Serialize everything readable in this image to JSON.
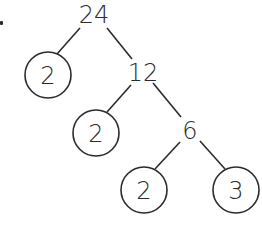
{
  "diagram": {
    "type": "factor-tree",
    "root": "24",
    "nodes": [
      {
        "id": "n24",
        "value": "24",
        "kind": "composite",
        "x": 94,
        "y": 15
      },
      {
        "id": "n2a",
        "value": "2",
        "kind": "prime",
        "x": 48,
        "y": 75
      },
      {
        "id": "n12",
        "value": "12",
        "kind": "composite",
        "x": 143,
        "y": 73
      },
      {
        "id": "n2b",
        "value": "2",
        "kind": "prime",
        "x": 96,
        "y": 133
      },
      {
        "id": "n6",
        "value": "6",
        "kind": "composite",
        "x": 190,
        "y": 131
      },
      {
        "id": "n2c",
        "value": "2",
        "kind": "prime",
        "x": 144,
        "y": 190
      },
      {
        "id": "n3",
        "value": "3",
        "kind": "prime",
        "x": 236,
        "y": 190
      }
    ],
    "edges": [
      {
        "from": "24",
        "to": "2",
        "x1": 80,
        "y1": 28,
        "x2": 57,
        "y2": 54
      },
      {
        "from": "24",
        "to": "12",
        "x1": 107,
        "y1": 28,
        "x2": 132,
        "y2": 59
      },
      {
        "from": "12",
        "to": "2",
        "x1": 131,
        "y1": 85,
        "x2": 107,
        "y2": 112
      },
      {
        "from": "12",
        "to": "6",
        "x1": 153,
        "y1": 83,
        "x2": 181,
        "y2": 117
      },
      {
        "from": "6",
        "to": "2",
        "x1": 180,
        "y1": 142,
        "x2": 155,
        "y2": 169
      },
      {
        "from": "6",
        "to": "3",
        "x1": 200,
        "y1": 141,
        "x2": 225,
        "y2": 169
      }
    ],
    "circle_radius": 23,
    "line_color": "#2b2b2b",
    "prime_factors": [
      "2",
      "2",
      "2",
      "3"
    ]
  },
  "labels": {
    "root": "24",
    "left_prime_1": "2",
    "mid_composite": "12",
    "left_prime_2": "2",
    "low_composite": "6",
    "left_prime_3": "2",
    "right_prime": "3"
  }
}
